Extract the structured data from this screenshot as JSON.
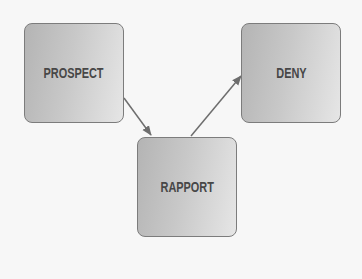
{
  "diagram": {
    "nodes": [
      {
        "id": "prospect",
        "label": "PROSPECT"
      },
      {
        "id": "rapport",
        "label": "RAPPORT"
      },
      {
        "id": "deny",
        "label": "DENY"
      }
    ],
    "edges": [
      {
        "from": "prospect",
        "to": "rapport"
      },
      {
        "from": "rapport",
        "to": "deny"
      }
    ],
    "colors": {
      "node_fill_dark": "#b4b4b4",
      "node_fill_light": "#e6e6e6",
      "node_border": "#7c7c7c",
      "text": "#474747",
      "arrow": "#6e6e6e",
      "background": "#f7f7f7"
    }
  }
}
